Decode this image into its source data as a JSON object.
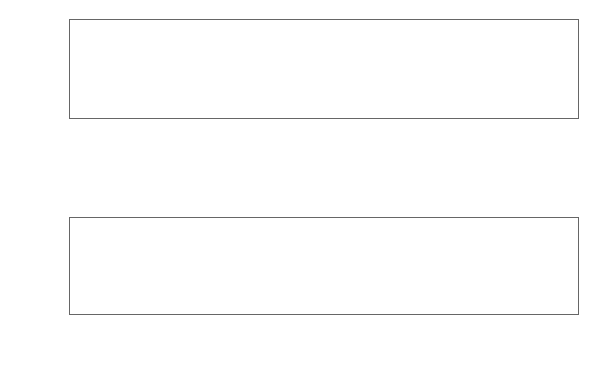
{
  "chart_data": [
    {
      "type": "line",
      "title": "",
      "xlabel": "Time",
      "ylabel": "x",
      "xlim": [
        0,
        200
      ],
      "ylim": [
        -6,
        4.6
      ],
      "grid": false,
      "x_ticks": [
        0,
        50,
        100,
        150,
        200
      ],
      "x_tick_labels": [
        "0",
        "50",
        "100",
        "150",
        "200"
      ],
      "y_ticks": [
        -6,
        -4,
        -2,
        0,
        2,
        4
      ],
      "y_tick_labels": [
        "-6",
        "",
        "-2",
        "0",
        "2",
        "4"
      ],
      "x_start": 1,
      "values": [
        1.2,
        1.0,
        0.8,
        -2.0,
        -5.8,
        -1.8,
        -1.4,
        -1.0,
        0.2,
        1.4,
        2.0,
        2.5,
        3.2,
        0.8,
        0.0,
        -1.0,
        -2.2,
        -3.9,
        -4.0,
        -2.0,
        0.2,
        1.8,
        3.1,
        3.1,
        2.6,
        0.8,
        -0.6,
        -1.6,
        -2.2,
        -2.5,
        -1.4,
        -0.5,
        0.4,
        1.6,
        2.6,
        1.4,
        0.2,
        -0.8,
        -0.9,
        -3.1,
        -1.9,
        -1.5,
        -1.2,
        1.0,
        3.0,
        2.2,
        1.8,
        1.5,
        -1.0,
        -2.8,
        -0.9,
        -1.5,
        -2.7,
        -0.8,
        1.8,
        2.9,
        2.6,
        2.4,
        3.6,
        1.6,
        -0.5,
        -2.8,
        -2.5,
        -2.2,
        -1.9,
        -1.0,
        0.6,
        2.2,
        2.1,
        4.4,
        0.6,
        -0.6,
        -1.4,
        -0.8,
        -2.4,
        -4.0,
        -4.4,
        -3.8,
        -2.0,
        1.8,
        2.3,
        2.5,
        2.5,
        2.5,
        1.4,
        -0.5,
        -2.8,
        -1.8,
        -2.9,
        -4.1,
        -1.4,
        0.5,
        1.4,
        1.0,
        2.3,
        4.2,
        3.0,
        0.4,
        -1.0,
        -2.4,
        -3.4,
        -4.5,
        -2.8,
        -0.8,
        1.6,
        2.4,
        3.1,
        3.6,
        1.8,
        1.6,
        1.2,
        -0.8,
        -2.6,
        -4.4,
        -2.2,
        -0.8,
        0.6,
        2.4,
        3.4,
        2.2,
        1.5,
        1.0,
        -0.4,
        -1.6,
        -3.4,
        -4.1,
        -2.6,
        -0.9,
        0.9,
        1.8,
        2.6,
        3.3,
        1.4,
        0.2,
        -0.6,
        -3.2,
        -1.2,
        -0.9,
        -2.8,
        -2.9,
        -2.4,
        -1.6,
        1.9,
        2.6,
        1.0,
        0.8,
        -0.6,
        -2.4,
        -4.4,
        -2.0,
        -0.6,
        0.9,
        1.7,
        1.9,
        2.0,
        -0.1,
        -1.2,
        -0.6,
        -1.8,
        -2.2,
        -3.6,
        -4.4,
        -1.5,
        0.9,
        2.6,
        4.5,
        2.0,
        -0.6,
        -1.8,
        -2.0,
        -2.1,
        -2.1,
        -1.4,
        0.9,
        4.6,
        3.8,
        3.5,
        0.5,
        -1.6,
        -2.6,
        -3.8,
        -1.8,
        -0.6,
        0.4,
        0.6,
        3.9,
        1.2,
        2.0,
        1.0,
        -1.6,
        -3.9,
        -3.6,
        -1.2,
        0.2,
        1.5,
        4.0,
        2.8,
        2.4,
        1.8,
        1.2,
        -1.0,
        -2.4,
        -2.8,
        -3.1,
        -1.2,
        -0.8,
        1.6,
        2.5,
        2.6,
        0.6,
        -0.2,
        -2.8,
        -3.4,
        -3.6,
        -2.2,
        -1.0,
        1.0,
        0.2,
        4.2,
        1.2,
        0.4
      ]
    },
    {
      "type": "line",
      "title": "",
      "xlabel": "w",
      "ylabel": "x",
      "xlim": [
        0,
        3.3
      ],
      "ylim": [
        0,
        400
      ],
      "grid": false,
      "x_ticks": [
        0.0,
        0.5,
        1.0,
        1.5,
        2.0,
        2.5,
        3.0
      ],
      "x_tick_labels": [
        "0.0",
        "0.5",
        "1.0",
        "1.5",
        "2.0",
        "2.5",
        "3.0"
      ],
      "y_ticks": [
        0,
        100,
        200,
        300
      ],
      "y_tick_labels": [
        "0",
        "100",
        "",
        "300"
      ],
      "x": [
        0.03,
        0.06,
        0.09,
        0.11,
        0.14,
        0.2,
        0.3,
        0.4,
        0.5,
        0.55,
        0.58,
        0.61,
        0.64,
        0.68,
        0.7,
        0.73,
        0.76,
        0.78,
        0.81,
        0.85,
        0.9,
        1.0,
        1.2,
        1.3,
        1.33,
        1.36,
        1.5,
        1.6,
        1.63,
        1.66,
        1.72,
        1.75,
        1.8,
        1.86,
        1.89,
        1.95,
        2.1,
        2.14,
        2.17,
        2.2,
        2.23,
        2.3,
        2.5,
        2.57,
        2.6,
        2.7,
        2.76,
        2.8,
        3.0,
        3.18
      ],
      "values": [
        2,
        3,
        6,
        7,
        3,
        2,
        2,
        2,
        2,
        4,
        6,
        3,
        5,
        8,
        14,
        379,
        40,
        12,
        8,
        6,
        3,
        2,
        2,
        2,
        6,
        2,
        2,
        2,
        5,
        2,
        2,
        5,
        2,
        2,
        4,
        2,
        2,
        5,
        3,
        5,
        3,
        2,
        2,
        5,
        2,
        2,
        4,
        2,
        1,
        1
      ],
      "peak": {
        "w": 0.73,
        "value": 379
      }
    }
  ]
}
